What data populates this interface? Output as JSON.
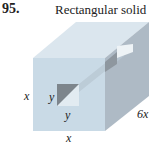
{
  "problem": {
    "number": "95.",
    "title": "Rectangular solid"
  },
  "labels": {
    "height": "x",
    "hole_height": "y",
    "hole_width": "y",
    "length": "6x",
    "width": "x"
  },
  "colors": {
    "front_face": "#c9dae6",
    "top_face": "#dbe6ee",
    "right_face": "#aebac5",
    "hole": "#7d858c",
    "text": "#222222"
  }
}
